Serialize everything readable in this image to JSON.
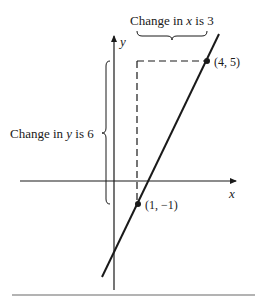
{
  "diagram": {
    "axes": {
      "x_label": "x",
      "y_label": "y"
    },
    "points": [
      {
        "name": "point-a",
        "label": "(4, 5)",
        "x": 4,
        "y": 5
      },
      {
        "name": "point-b",
        "label": "(1, −1)",
        "x": 1,
        "y": -1
      }
    ],
    "change_x": {
      "prefix": "Change in ",
      "var": "x",
      "suffix": " is 3",
      "value": 3
    },
    "change_y": {
      "prefix": "Change in ",
      "var": "y",
      "suffix": " is 6",
      "value": 6
    },
    "line": {
      "slope": 2,
      "intercept": -3
    },
    "colors": {
      "ink": "#1a1a1a",
      "rule": "#9a9a9a"
    }
  }
}
